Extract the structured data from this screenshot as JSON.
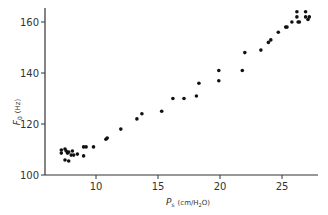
{
  "chart_data": {
    "type": "scatter",
    "title": "",
    "xlabel": "Ps (cm/H2O)",
    "xlabel_main": "P",
    "xlabel_sub": "s",
    "xlabel_units": "(cm/H",
    "xlabel_units_sub": "2",
    "xlabel_units_end": "O)",
    "ylabel": "F0 (Hz)",
    "ylabel_main": "F",
    "ylabel_sub": "0",
    "ylabel_units": "(Hz)",
    "xlim": [
      6.0,
      28.0
    ],
    "ylim": [
      100,
      165
    ],
    "xticks": [
      10,
      15,
      20,
      25
    ],
    "yticks": [
      100,
      120,
      140,
      160
    ],
    "grid": false,
    "legend": null,
    "series": [
      {
        "name": "F0 vs Ps",
        "color": "#111111",
        "points": [
          [
            7.2,
            109.8
          ],
          [
            7.2,
            108.6
          ],
          [
            7.5,
            110.2
          ],
          [
            7.6,
            109.4
          ],
          [
            7.7,
            108.6
          ],
          [
            7.8,
            109.0
          ],
          [
            8.0,
            107.8
          ],
          [
            8.1,
            109.4
          ],
          [
            8.2,
            107.8
          ],
          [
            7.5,
            105.9
          ],
          [
            7.8,
            105.5
          ],
          [
            8.5,
            108.2
          ],
          [
            9.0,
            111.0
          ],
          [
            9.2,
            111.0
          ],
          [
            9.0,
            107.5
          ],
          [
            9.8,
            111.0
          ],
          [
            10.8,
            114.0
          ],
          [
            10.9,
            114.5
          ],
          [
            12.0,
            118.0
          ],
          [
            13.3,
            122.0
          ],
          [
            13.7,
            124.0
          ],
          [
            15.3,
            125.0
          ],
          [
            16.2,
            130.0
          ],
          [
            17.1,
            130.0
          ],
          [
            18.1,
            131.0
          ],
          [
            18.3,
            136.0
          ],
          [
            19.9,
            137.0
          ],
          [
            19.9,
            141.0
          ],
          [
            21.8,
            141.0
          ],
          [
            22.0,
            148.0
          ],
          [
            23.3,
            149.0
          ],
          [
            23.9,
            152.0
          ],
          [
            24.1,
            153.0
          ],
          [
            24.7,
            156.0
          ],
          [
            25.3,
            158.0
          ],
          [
            25.4,
            158.0
          ],
          [
            25.8,
            160.0
          ],
          [
            26.2,
            162.0
          ],
          [
            26.3,
            160.0
          ],
          [
            26.4,
            160.0
          ],
          [
            26.9,
            162.0
          ],
          [
            27.2,
            162.0
          ],
          [
            26.2,
            164.0
          ],
          [
            26.9,
            164.0
          ],
          [
            27.1,
            161.0
          ]
        ]
      }
    ]
  },
  "layout": {
    "origin_px": [
      45,
      175
    ],
    "x_px_per_unit": 12.4,
    "y_px_per_unit": 2.55,
    "x_axis_end_px": 318,
    "y_axis_top_px": 8
  }
}
